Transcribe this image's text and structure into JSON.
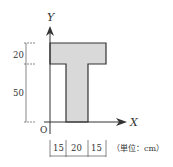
{
  "diagram": {
    "axes": {
      "x_label": "X",
      "y_label": "Y",
      "origin_label": "O"
    },
    "shape": {
      "name": "T-section",
      "fill": "#d9d9d9",
      "stroke": "#333333"
    },
    "vertical_dimensions": [
      {
        "value": "20",
        "meaning": "flange height"
      },
      {
        "value": "50",
        "meaning": "web height"
      }
    ],
    "horizontal_dimensions": [
      {
        "value": "15"
      },
      {
        "value": "20"
      },
      {
        "value": "15"
      }
    ],
    "unit_note": "（単位：cm）"
  }
}
